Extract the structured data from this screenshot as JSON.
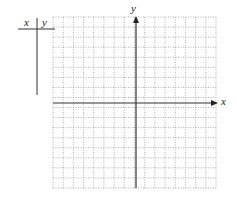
{
  "table": {
    "headers": [
      "x",
      "y"
    ],
    "rows": []
  },
  "graph": {
    "x_axis_label": "x",
    "y_axis_label": "y",
    "grid": {
      "columns": 16,
      "rows": 17,
      "style": "dotted",
      "color": "#9a9a9a"
    },
    "axis_color": "#333333"
  }
}
